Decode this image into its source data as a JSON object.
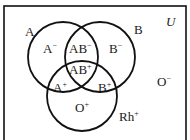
{
  "diagram": {
    "universe_label": "U",
    "stroke_color": "#111111",
    "background": "#ffffff",
    "frame": {
      "x": 4,
      "y": 6,
      "width": 182,
      "height": 140
    },
    "sets": [
      {
        "id": "A",
        "label": "A",
        "cx": 63,
        "cy": 57,
        "r": 35,
        "label_x": 25,
        "label_y": 36
      },
      {
        "id": "B",
        "label": "B",
        "cx": 100,
        "cy": 57,
        "r": 35,
        "label_x": 134,
        "label_y": 34
      },
      {
        "id": "Rh",
        "label": "Rh",
        "label_sup": "+",
        "cx": 82,
        "cy": 96,
        "r": 35,
        "label_x": 119,
        "label_y": 121
      }
    ],
    "regions": [
      {
        "id": "A-neg",
        "base": "A",
        "sup": "−",
        "x": 43,
        "y": 53
      },
      {
        "id": "AB-neg",
        "base": "AB",
        "sup": "−",
        "x": 69,
        "y": 53
      },
      {
        "id": "B-neg",
        "base": "B",
        "sup": "−",
        "x": 109,
        "y": 53
      },
      {
        "id": "AB-pos",
        "base": "AB",
        "sup": "+",
        "x": 69,
        "y": 74
      },
      {
        "id": "A-pos",
        "base": "A",
        "sup": "+",
        "x": 53,
        "y": 92
      },
      {
        "id": "B-pos",
        "base": "B",
        "sup": "+",
        "x": 98,
        "y": 92
      },
      {
        "id": "O-pos",
        "base": "O",
        "sup": "+",
        "x": 75,
        "y": 112
      },
      {
        "id": "O-neg",
        "base": "O",
        "sup": "−",
        "x": 157,
        "y": 86
      }
    ]
  }
}
